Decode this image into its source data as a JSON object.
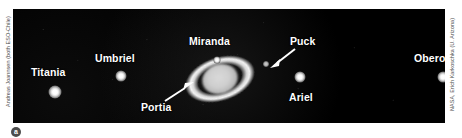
{
  "figure": {
    "badge_label": "a",
    "panel_background": "#000000"
  },
  "credits": {
    "left": "Andreas Joannsen (both ESO-Chile)",
    "right": "NASA, Erich Karkoschka (U. Arizona)"
  },
  "objects": {
    "planet": {
      "name": "Uranus",
      "has_rings": true
    },
    "moons": [
      {
        "label": "Titania",
        "label_x": 18,
        "label_y": 58,
        "dot_x": 42,
        "dot_y": 83,
        "dot_size": 13
      },
      {
        "label": "Umbriel",
        "label_x": 82,
        "label_y": 44,
        "dot_x": 108,
        "dot_y": 67,
        "dot_size": 11
      },
      {
        "label": "Miranda",
        "label_x": 176,
        "label_y": 27,
        "dot_x": 204,
        "dot_y": 51,
        "dot_size": 7
      },
      {
        "label": "Puck",
        "label_x": 277,
        "label_y": 27,
        "dot_x": 253,
        "dot_y": 55,
        "dot_size": 6
      },
      {
        "label": "Ariel",
        "label_x": 276,
        "label_y": 83,
        "dot_x": 287,
        "dot_y": 68,
        "dot_size": 11
      },
      {
        "label": "Oberon",
        "label_x": 401,
        "label_y": 44,
        "dot_x": 430,
        "dot_y": 68,
        "dot_size": 11
      },
      {
        "label": "Portia",
        "label_x": 128,
        "label_y": 93,
        "dot_x": 0,
        "dot_y": 0,
        "dot_size": 0
      }
    ]
  },
  "colors": {
    "background": "#ffffff",
    "sky": "#000000",
    "label_text": "#ffffff",
    "credit_text": "#4a4a4a",
    "badge": "#4d4d4d"
  }
}
